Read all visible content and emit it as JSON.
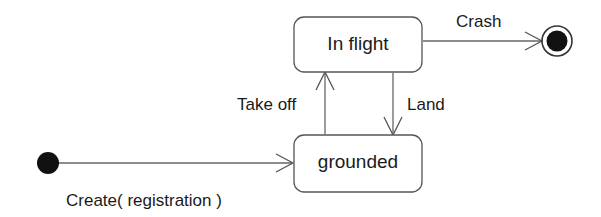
{
  "diagram": {
    "type": "uml-state-machine",
    "background_color": "#ffffff",
    "line_color": "#666666",
    "text_color": "#1a1a1a",
    "states": [
      {
        "id": "in-flight",
        "label": "In flight",
        "kind": "simple-state",
        "x": 294,
        "y": 17,
        "width": 128,
        "height": 55,
        "corner_radius": 10
      },
      {
        "id": "grounded",
        "label": "grounded",
        "kind": "simple-state",
        "x": 294,
        "y": 135,
        "width": 128,
        "height": 57,
        "corner_radius": 10
      }
    ],
    "pseudostates": [
      {
        "id": "initial",
        "kind": "initial",
        "cx": 48,
        "cy": 163,
        "r": 11
      },
      {
        "id": "final",
        "kind": "final",
        "cx": 557,
        "cy": 41,
        "outer_r": 15,
        "inner_r": 10
      }
    ],
    "transitions": [
      {
        "id": "create",
        "label": "Create( registration )",
        "from": "initial",
        "to": "grounded",
        "label_x": 66,
        "label_y": 206
      },
      {
        "id": "take-off",
        "label": "Take off",
        "from": "grounded",
        "to": "in-flight",
        "label_x": 237,
        "label_y": 110
      },
      {
        "id": "land",
        "label": "Land",
        "from": "in-flight",
        "to": "grounded",
        "label_x": 407,
        "label_y": 110
      },
      {
        "id": "crash",
        "label": "Crash",
        "from": "in-flight",
        "to": "final",
        "label_x": 456,
        "label_y": 27
      }
    ]
  }
}
